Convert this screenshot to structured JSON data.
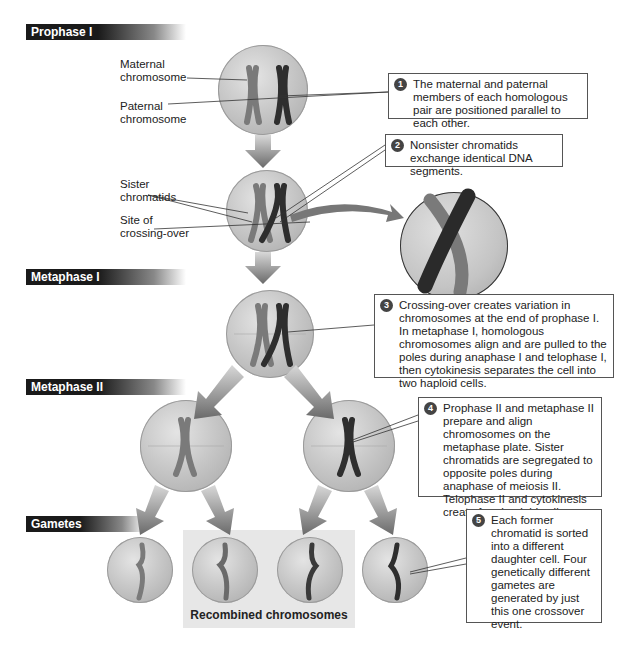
{
  "stages": {
    "prophase_i": "Prophase I",
    "metaphase_i": "Metaphase I",
    "metaphase_ii": "Metaphase II",
    "gametes": "Gametes"
  },
  "labels": {
    "maternal": "Maternal chromosome",
    "maternal_l1": "Maternal",
    "maternal_l2": "chromosome",
    "paternal_l1": "Paternal",
    "paternal_l2": "chromosome",
    "sister_l1": "Sister",
    "sister_l2": "chromatids",
    "site_l1": "Site of",
    "site_l2": "crossing-over",
    "recombined": "Recombined chromosomes"
  },
  "callouts": [
    {
      "num": "1",
      "text": "The maternal and paternal members of each homologous pair are positioned parallel to each other."
    },
    {
      "num": "2",
      "text": "Nonsister chromatids exchange identical DNA segments."
    },
    {
      "num": "3",
      "text": "Crossing-over creates variation in chromosomes at the end of prophase I. In metaphase I, homologous chromosomes align and are pulled to the poles during anaphase I and telophase I, then cytokinesis separates the cell into two haploid cells."
    },
    {
      "num": "4",
      "text": "Prophase II and metaphase II prepare and align chromosomes on the metaphase plate. Sister chromatids are segregated to opposite poles during anaphase of meiosis II. Telophase II and cytokinesis create four haploid cells."
    },
    {
      "num": "5",
      "text": "Each former chromatid is sorted into a different daughter cell. Four genetically different gametes are generated by just this one crossover event."
    }
  ],
  "colors": {
    "maternal": "#7a7a7a",
    "paternal": "#2e2e2e",
    "cell": "#c4c4c4",
    "stage_bar": "#1a1a1a"
  }
}
